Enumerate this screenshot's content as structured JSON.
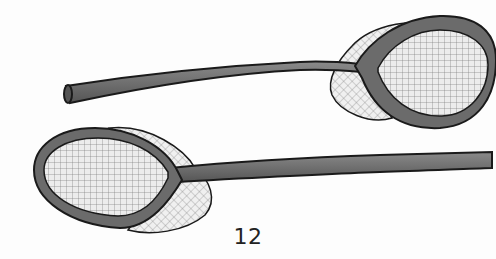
{
  "page": {
    "page_number": "12",
    "illustration": {
      "subject": "two racquet-shaped nets with long handles",
      "items": [
        {
          "name": "top-racquet",
          "orientation": "handle-left, head-right"
        },
        {
          "name": "bottom-racquet",
          "orientation": "head-left, handle-right"
        }
      ],
      "colors": {
        "background": "#fdfdfd",
        "frame": "#6b6b6b",
        "outline": "#1a1a1a",
        "mesh": "#8a8a8a",
        "mesh_fill": "#e6e6e6"
      }
    }
  }
}
